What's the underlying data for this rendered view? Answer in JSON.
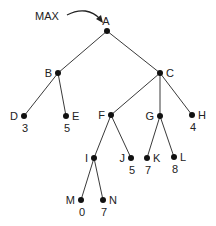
{
  "diagram": {
    "type": "game-tree",
    "annotation": {
      "label": "MAX",
      "points_to": "A"
    },
    "nodes": [
      {
        "id": "A",
        "label": "A",
        "value": null,
        "x": 107,
        "y": 31,
        "label_pos": "top"
      },
      {
        "id": "B",
        "label": "B",
        "value": null,
        "x": 58,
        "y": 73,
        "label_pos": "left"
      },
      {
        "id": "C",
        "label": "C",
        "value": null,
        "x": 160,
        "y": 73,
        "label_pos": "right"
      },
      {
        "id": "D",
        "label": "D",
        "value": "3",
        "x": 24,
        "y": 116,
        "label_pos": "left"
      },
      {
        "id": "E",
        "label": "E",
        "value": "5",
        "x": 66,
        "y": 116,
        "label_pos": "right"
      },
      {
        "id": "F",
        "label": "F",
        "value": null,
        "x": 111,
        "y": 115,
        "label_pos": "left"
      },
      {
        "id": "G",
        "label": "G",
        "value": null,
        "x": 160,
        "y": 116,
        "label_pos": "left"
      },
      {
        "id": "H",
        "label": "H",
        "value": "4",
        "x": 192,
        "y": 115,
        "label_pos": "right"
      },
      {
        "id": "I",
        "label": "I",
        "value": null,
        "x": 94,
        "y": 158,
        "label_pos": "left"
      },
      {
        "id": "J",
        "label": "J",
        "value": "5",
        "x": 131,
        "y": 158,
        "label_pos": "left"
      },
      {
        "id": "K",
        "label": "K",
        "value": "7",
        "x": 147,
        "y": 158,
        "label_pos": "right"
      },
      {
        "id": "L",
        "label": "L",
        "value": "8",
        "x": 174,
        "y": 157,
        "label_pos": "right"
      },
      {
        "id": "M",
        "label": "M",
        "value": "0",
        "x": 81,
        "y": 200,
        "label_pos": "left"
      },
      {
        "id": "N",
        "label": "N",
        "value": "7",
        "x": 103,
        "y": 200,
        "label_pos": "right"
      }
    ],
    "edges": [
      [
        "A",
        "B"
      ],
      [
        "A",
        "C"
      ],
      [
        "B",
        "D"
      ],
      [
        "B",
        "E"
      ],
      [
        "C",
        "F"
      ],
      [
        "C",
        "G"
      ],
      [
        "C",
        "H"
      ],
      [
        "F",
        "I"
      ],
      [
        "F",
        "J"
      ],
      [
        "G",
        "K"
      ],
      [
        "G",
        "L"
      ],
      [
        "I",
        "M"
      ],
      [
        "I",
        "N"
      ]
    ]
  }
}
